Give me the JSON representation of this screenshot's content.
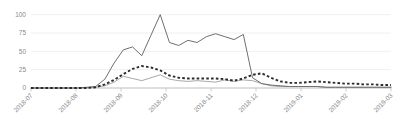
{
  "chart_data": {
    "type": "line",
    "title": "",
    "subtitle": "",
    "xlabel": "",
    "ylabel": "",
    "ylim": [
      0,
      105
    ],
    "yticks": [
      0,
      25,
      50,
      75,
      100
    ],
    "ytick_labels": [
      "0",
      "25",
      "50",
      "75",
      "100"
    ],
    "grid": true,
    "grid_axis": "y",
    "legend": "none",
    "legend_position": "none",
    "xtick_labels": [
      "2018-07",
      "2018-08",
      "2018-09",
      "2018-10",
      "2018-11",
      "2018-12",
      "2019-01",
      "2019-02",
      "2019-03"
    ],
    "xtick_rotation": -45,
    "x": [
      "2018-07-01",
      "2018-07-08",
      "2018-07-15",
      "2018-07-22",
      "2018-07-29",
      "2018-08-05",
      "2018-08-12",
      "2018-08-19",
      "2018-08-26",
      "2018-09-02",
      "2018-09-09",
      "2018-09-16",
      "2018-09-23",
      "2018-09-30",
      "2018-10-07",
      "2018-10-14",
      "2018-10-21",
      "2018-10-28",
      "2018-11-04",
      "2018-11-11",
      "2018-11-18",
      "2018-11-25",
      "2018-12-02",
      "2018-12-09",
      "2018-12-16",
      "2018-12-23",
      "2018-12-30",
      "2019-01-06",
      "2019-01-13",
      "2019-01-20",
      "2019-01-27",
      "2019-02-03",
      "2019-02-10",
      "2019-02-17",
      "2019-02-24",
      "2019-03-03",
      "2019-03-10",
      "2019-03-17",
      "2019-03-24",
      "2019-03-31"
    ],
    "series": [
      {
        "name": "series-1",
        "style": "solid",
        "color": "#6f6f6f",
        "values": [
          0,
          0,
          0,
          0,
          0,
          0,
          1,
          2,
          12,
          34,
          52,
          56,
          44,
          72,
          100,
          62,
          58,
          65,
          62,
          70,
          74,
          70,
          66,
          73,
          14,
          6,
          4,
          3,
          2,
          2,
          2,
          2,
          1,
          1,
          1,
          1,
          1,
          1,
          1,
          1
        ]
      },
      {
        "name": "series-2",
        "style": "dashed",
        "color": "#2b2b2b",
        "values": [
          0,
          0,
          0,
          0,
          0,
          0,
          0,
          1,
          5,
          11,
          19,
          26,
          30,
          28,
          24,
          17,
          14,
          13,
          13,
          13,
          13,
          12,
          10,
          13,
          18,
          20,
          14,
          9,
          7,
          7,
          8,
          9,
          8,
          7,
          6,
          6,
          5,
          5,
          4,
          4
        ]
      },
      {
        "name": "series-3",
        "style": "solid",
        "color": "#a8a8a8",
        "values": [
          0,
          0,
          0,
          0,
          0,
          0,
          0,
          1,
          3,
          8,
          16,
          13,
          10,
          14,
          18,
          12,
          10,
          9,
          10,
          9,
          8,
          11,
          9,
          11,
          10,
          6,
          3,
          2,
          2,
          2,
          2,
          2,
          1,
          1,
          1,
          1,
          1,
          1,
          1,
          1
        ]
      }
    ]
  }
}
